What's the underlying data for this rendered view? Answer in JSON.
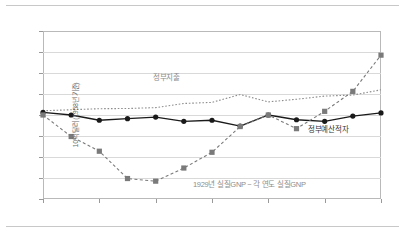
{
  "chart_data": {
    "type": "line",
    "title": "",
    "xlabel": "연도",
    "ylabel": "10억 달러 (1958년 기준)",
    "x": [
      1929,
      1930,
      1931,
      1932,
      1933,
      1934,
      1935,
      1936,
      1937,
      1938,
      1939,
      1940,
      1941
    ],
    "xtick_labels": [
      "1929",
      "1931",
      "1933",
      "1935",
      "1937",
      "1939",
      "1941"
    ],
    "xticks": [
      1929,
      1931,
      1933,
      1935,
      1937,
      1939,
      1941
    ],
    "ytick_labels": [
      "80.0",
      "60.0",
      "40.0",
      "20.0",
      "0.0",
      "-20.0",
      "-40.0",
      "-60.0",
      "-80.0"
    ],
    "yticks": [
      80,
      60,
      40,
      20,
      0,
      -20,
      -40,
      -60,
      -80
    ],
    "ylim": [
      -80,
      80
    ],
    "xlim": [
      1929,
      1941
    ],
    "grid": true,
    "legend_position": "inline-annotations",
    "series": [
      {
        "name": "정부지출",
        "style": "dotted",
        "color": "#8d8d8d",
        "marker": "none",
        "values": [
          4.0,
          5.0,
          6.0,
          6.2,
          7.0,
          11.0,
          12.0,
          19.5,
          12.5,
          15.0,
          18.0,
          19.0,
          24.0
        ]
      },
      {
        "name": "정부예산적자",
        "style": "solid",
        "color": "#1a1a1a",
        "marker": "circle",
        "values": [
          2.5,
          0.0,
          -5.0,
          -3.5,
          -2.0,
          -6.0,
          -5.0,
          -10.5,
          0.0,
          -4.5,
          -6.0,
          -1.0,
          2.0
        ]
      },
      {
        "name": "1929년 실질GNP − 각 연도 실질GNP",
        "style": "dashed",
        "color": "#7a7a7a",
        "marker": "square",
        "values": [
          0.0,
          -20.5,
          -34.5,
          -60.5,
          -63.0,
          -50.5,
          -35.5,
          -11.0,
          0.0,
          -13.0,
          3.5,
          22.5,
          57.0
        ]
      }
    ],
    "annotations": [
      {
        "name": "정부지출",
        "x": 1931.0,
        "y": 34.0
      },
      {
        "name": "1929년 실질GNP − 각 연도 실질GNP",
        "x": 1933.8,
        "y": -69.0
      },
      {
        "name": "정부예산적자",
        "x": 1939.0,
        "y": -13.0
      }
    ]
  },
  "axis": {
    "y_title": "10억 달러 (1958년 기준)",
    "x_title": "연도"
  }
}
